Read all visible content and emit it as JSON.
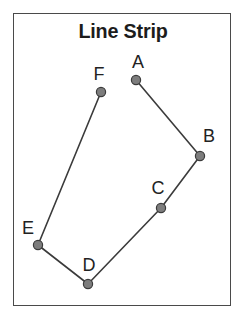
{
  "figure": {
    "title": "Line Strip",
    "type": "line-strip-diagram",
    "width": 246,
    "height": 321,
    "background_color": "#ffffff",
    "frame": {
      "x": 13,
      "y": 13,
      "width": 218,
      "height": 293,
      "border_color": "#4a4a4a",
      "border_width": 1
    },
    "style": {
      "line_color": "#3b3b3b",
      "line_width": 1.6,
      "vertex_fill": "#7d7d7d",
      "vertex_stroke": "#3b3b3b",
      "vertex_radius": 4.6,
      "label_color": "#222222",
      "title_color": "#1c1c1c"
    }
  },
  "chart_data": {
    "type": "line",
    "title": "Line Strip",
    "xlabel": "",
    "ylabel": "",
    "grid": false,
    "legend": false,
    "closed": false,
    "vertex_order": [
      "A",
      "B",
      "C",
      "D",
      "E",
      "F"
    ],
    "points": [
      {
        "label": "A",
        "x": 136,
        "y": 80,
        "label_x": 138,
        "label_y": 62
      },
      {
        "label": "B",
        "x": 200,
        "y": 156,
        "label_x": 209,
        "label_y": 136
      },
      {
        "label": "C",
        "x": 161,
        "y": 208,
        "label_x": 158,
        "label_y": 188
      },
      {
        "label": "D",
        "x": 88,
        "y": 284,
        "label_x": 89,
        "label_y": 265
      },
      {
        "label": "E",
        "x": 38,
        "y": 245,
        "label_x": 28,
        "label_y": 228
      },
      {
        "label": "F",
        "x": 101,
        "y": 92,
        "label_x": 99,
        "label_y": 74
      }
    ],
    "segments": [
      {
        "from": "A",
        "to": "B"
      },
      {
        "from": "B",
        "to": "C"
      },
      {
        "from": "C",
        "to": "D"
      },
      {
        "from": "D",
        "to": "E"
      },
      {
        "from": "E",
        "to": "F"
      }
    ]
  }
}
